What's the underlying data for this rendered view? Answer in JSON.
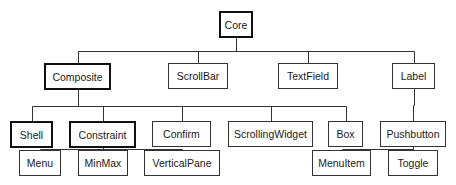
{
  "diagram": {
    "type": "class-hierarchy-tree",
    "line_color": "#333333",
    "nodes": [
      {
        "id": "core",
        "label": "Core",
        "emphasized": true,
        "x": 219,
        "y": 11,
        "w": 34,
        "h": 27
      },
      {
        "id": "composite",
        "label": "Composite",
        "emphasized": true,
        "x": 44,
        "y": 63,
        "w": 67,
        "h": 27
      },
      {
        "id": "scrollbar",
        "label": "ScrollBar",
        "emphasized": false,
        "x": 168,
        "y": 63,
        "w": 60,
        "h": 26
      },
      {
        "id": "textfield",
        "label": "TextField",
        "emphasized": false,
        "x": 278,
        "y": 63,
        "w": 60,
        "h": 26
      },
      {
        "id": "label",
        "label": "Label",
        "emphasized": false,
        "x": 392,
        "y": 63,
        "w": 43,
        "h": 26
      },
      {
        "id": "shell",
        "label": "Shell",
        "emphasized": true,
        "x": 10,
        "y": 121,
        "w": 43,
        "h": 27
      },
      {
        "id": "constraint",
        "label": "Constraint",
        "emphasized": true,
        "x": 69,
        "y": 121,
        "w": 67,
        "h": 27
      },
      {
        "id": "confirm",
        "label": "Confirm",
        "emphasized": false,
        "x": 152,
        "y": 121,
        "w": 59,
        "h": 26
      },
      {
        "id": "scrollingwidget",
        "label": "ScrollingWidget",
        "emphasized": false,
        "x": 228,
        "y": 121,
        "w": 85,
        "h": 26
      },
      {
        "id": "box",
        "label": "Box",
        "emphasized": false,
        "x": 328,
        "y": 121,
        "w": 35,
        "h": 26
      },
      {
        "id": "pushbutton",
        "label": "Pushbutton",
        "emphasized": false,
        "x": 380,
        "y": 121,
        "w": 66,
        "h": 26
      },
      {
        "id": "menu",
        "label": "Menu",
        "emphasized": false,
        "x": 19,
        "y": 150,
        "w": 42,
        "h": 26
      },
      {
        "id": "minmax",
        "label": "MinMax",
        "emphasized": false,
        "x": 78,
        "y": 150,
        "w": 50,
        "h": 26
      },
      {
        "id": "verticalpane",
        "label": "VerticalPane",
        "emphasized": false,
        "x": 144,
        "y": 150,
        "w": 76,
        "h": 26
      },
      {
        "id": "menuitem",
        "label": "MenuItem",
        "emphasized": false,
        "x": 312,
        "y": 150,
        "w": 59,
        "h": 26
      },
      {
        "id": "toggle",
        "label": "Toggle",
        "emphasized": false,
        "x": 388,
        "y": 150,
        "w": 50,
        "h": 26
      }
    ],
    "edges": [
      {
        "parent": "core",
        "children": [
          "composite",
          "scrollbar",
          "textfield",
          "label"
        ]
      },
      {
        "parent": "composite",
        "children": [
          "shell",
          "constraint",
          "confirm",
          "scrollingwidget",
          "box"
        ]
      },
      {
        "parent": "label",
        "children": [
          "pushbutton"
        ]
      },
      {
        "parent": "constraint",
        "children": [
          "menu",
          "minmax",
          "verticalpane"
        ]
      },
      {
        "parent": "pushbutton",
        "children": [
          "menuitem",
          "toggle"
        ]
      }
    ]
  }
}
